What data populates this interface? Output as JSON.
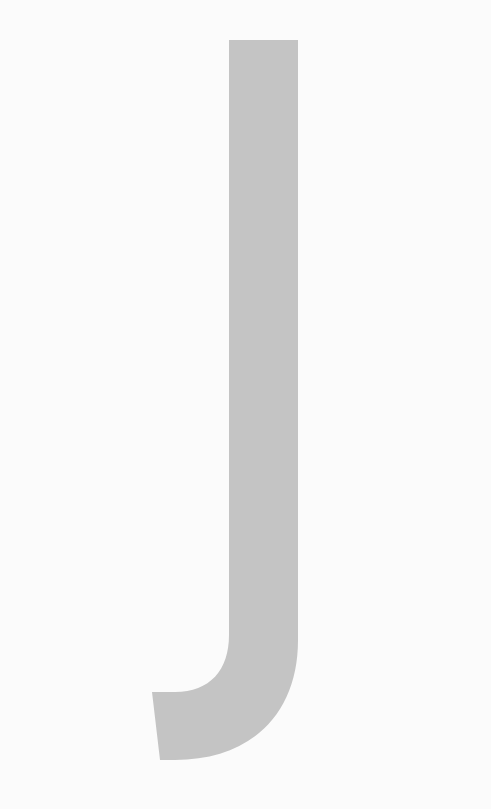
{
  "image": {
    "letter": "J",
    "glyph_color": "#c4c4c4",
    "background_color": "#fbfbfb"
  }
}
